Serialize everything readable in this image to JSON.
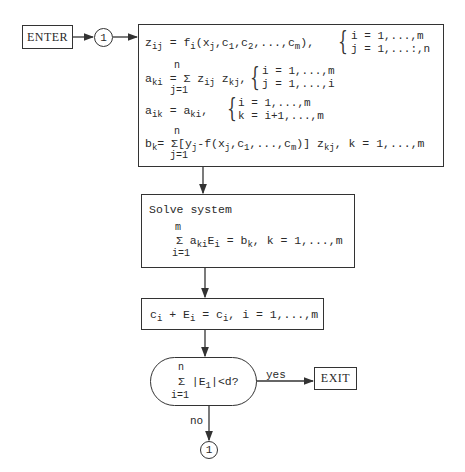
{
  "flowchart": {
    "start": {
      "label": "ENTER"
    },
    "connector_top": {
      "label": "1"
    },
    "setup_box": {
      "row1": {
        "lhs": "z",
        "lhs_sub": "ij",
        "rhs": "= f",
        "rhs_sub": "i",
        "args": "(x",
        "args_sub": "j",
        "args2": ",c",
        "args2_sub": "1",
        "args3": ",c",
        "args3_sub": "2",
        "args4": ",...,c",
        "args4_sub": "m",
        "args5": "),",
        "cond1": "i = 1,...,m",
        "cond2": "j = 1,...:,n"
      },
      "row2": {
        "lhs": "a",
        "lhs_sub": "ki",
        "eq": "= Σ z",
        "z1_sub": "ij",
        "z2": " z",
        "z2_sub": "kj",
        "tail": ",",
        "upper": "n",
        "lower": "j=1",
        "cond1": "i = 1,...,m",
        "cond2": "j = 1,...,i"
      },
      "row3": {
        "lhs": "a",
        "lhs_sub": "ik",
        "eq": "= a",
        "rhs_sub": "ki",
        "tail": ",",
        "cond1": "i = 1,...,m",
        "cond2": "k = i+1,...,m"
      },
      "row4": {
        "lhs": "b",
        "lhs_sub": "k",
        "eq": "= Σ",
        "upper": "n",
        "lower": "j=1",
        "bracket": "[y",
        "y_sub": "j",
        "mid": "-f(x",
        "x_sub": "j",
        "mid2": ",c",
        "c1_sub": "1",
        "mid3": ",...,c",
        "cm_sub": "m",
        "mid4": ")] z",
        "z_sub": "kj",
        "tail": ",   k = 1,...,m"
      }
    },
    "solve_box": {
      "title": "Solve system",
      "upper": "m",
      "sigma": "Σ a",
      "a_sub": "ki",
      "e": "E",
      "e_sub": "i",
      "rhs": " = b",
      "b_sub": "k",
      "tail": ",   k = 1,...,m",
      "lower": "i=1"
    },
    "update_box": {
      "c": "c",
      "c_sub": "i",
      "plus": " + E",
      "e_sub": "i",
      "eq": " = c",
      "c2_sub": "i",
      "tail": ",    i = 1,...,m"
    },
    "decision": {
      "upper": "n",
      "sigma": "Σ  |E",
      "e_sub": "1",
      "tail": "|<d?",
      "lower": "i=1",
      "yes_label": "yes",
      "no_label": "no"
    },
    "end": {
      "label": "EXIT"
    },
    "connector_bottom": {
      "label": "1"
    }
  }
}
